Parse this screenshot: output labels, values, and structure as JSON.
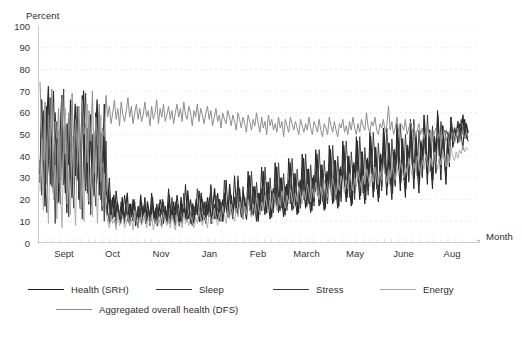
{
  "chart_data": {
    "type": "line",
    "title": "",
    "subtitle": "",
    "xlabel": "Month",
    "ylabel": "Percent",
    "ylim": [
      0,
      100
    ],
    "ytick_labels": [
      "100",
      "90",
      "80",
      "70",
      "60",
      "50",
      "40",
      "30",
      "20",
      "10",
      "0"
    ],
    "ytick_values": [
      100,
      90,
      80,
      70,
      60,
      50,
      40,
      30,
      20,
      10,
      0
    ],
    "xtick_labels": [
      "Sept",
      "Oct",
      "Nov",
      "Jan",
      "Feb",
      "March",
      "May",
      "June",
      "Aug"
    ],
    "grid": "horizontal-dashed-light",
    "legend_position": "below-plot-left",
    "axis_style": "arrow-ended-l-shape",
    "legend": [
      {
        "name": "Health (SRH)",
        "color": "#232323",
        "width": 1.0
      },
      {
        "name": "Sleep",
        "color": "#2b2b2b",
        "width": 1.3
      },
      {
        "name": "Stress",
        "color": "#3a3a3a",
        "width": 0.9
      },
      {
        "name": "Energy",
        "color": "#a8a8a8",
        "width": 0.9
      },
      {
        "name": "Aggregated overall health (DFS)",
        "color": "#8d8d8d",
        "width": 1.0
      }
    ],
    "series": [
      {
        "name": "Health (SRH)",
        "color": "#232323",
        "values": [
          32,
          58,
          44,
          21,
          63,
          38,
          27,
          52,
          70,
          34,
          18,
          47,
          29,
          61,
          40,
          23,
          55,
          36,
          66,
          26,
          49,
          31,
          57,
          20,
          43,
          68,
          35,
          24,
          53,
          39,
          17,
          46,
          28,
          60,
          33,
          22,
          51,
          37,
          64,
          25,
          19,
          30,
          14,
          21,
          12,
          24,
          16,
          11,
          19,
          13,
          22,
          15,
          10,
          18,
          12,
          20,
          14,
          9,
          17,
          11,
          19,
          13,
          21,
          10,
          16,
          12,
          23,
          14,
          11,
          18,
          13,
          20,
          15,
          9,
          17,
          12,
          25,
          14,
          11,
          19,
          13,
          22,
          16,
          10,
          18,
          12,
          27,
          15,
          11,
          20,
          14,
          9,
          17,
          13,
          24,
          16,
          10,
          19,
          12,
          21,
          15,
          26,
          13,
          18,
          11,
          23,
          16,
          10,
          20,
          14,
          29,
          17,
          12,
          22,
          15,
          31,
          18,
          13,
          25,
          16,
          11,
          21,
          14,
          33,
          19,
          12,
          26,
          17,
          10,
          23,
          15,
          35,
          20,
          13,
          28,
          18,
          11,
          24,
          16,
          37,
          22,
          14,
          30,
          19,
          12,
          26,
          17,
          39,
          23,
          15,
          32,
          20,
          13,
          28,
          18,
          41,
          24,
          16,
          34,
          21,
          14,
          30,
          19,
          43,
          26,
          17,
          36,
          22,
          15,
          32,
          20,
          45,
          27,
          18,
          38,
          24,
          16,
          34,
          21,
          47,
          29,
          19,
          40,
          25,
          17,
          36,
          23,
          49,
          31,
          20,
          42,
          27,
          18,
          38,
          24,
          51,
          33,
          21,
          44,
          28,
          19,
          40,
          26,
          53,
          35,
          22,
          46,
          30,
          20,
          42,
          27,
          55,
          37,
          24,
          48,
          32,
          21,
          44,
          29,
          57,
          39,
          25,
          50,
          34,
          23,
          46,
          31,
          59,
          41,
          27,
          52,
          36,
          25,
          48,
          33,
          61,
          43,
          29,
          54,
          38,
          27,
          50,
          35,
          58,
          44,
          48,
          52,
          46,
          55,
          50,
          43,
          57,
          51,
          47
        ]
      },
      {
        "name": "Sleep",
        "color": "#2b2b2b",
        "values": [
          28,
          66,
          39,
          17,
          55,
          72,
          31,
          44,
          23,
          60,
          35,
          19,
          50,
          68,
          27,
          41,
          14,
          57,
          33,
          21,
          46,
          64,
          29,
          37,
          16,
          53,
          70,
          25,
          43,
          18,
          59,
          31,
          22,
          48,
          66,
          27,
          39,
          15,
          54,
          20,
          13,
          24,
          10,
          17,
          22,
          12,
          19,
          14,
          9,
          21,
          11,
          16,
          23,
          10,
          18,
          13,
          20,
          8,
          15,
          11,
          22,
          12,
          17,
          9,
          19,
          14,
          10,
          21,
          12,
          16,
          8,
          18,
          13,
          20,
          11,
          15,
          9,
          22,
          12,
          17,
          10,
          19,
          14,
          8,
          21,
          13,
          16,
          11,
          24,
          15,
          9,
          18,
          12,
          20,
          14,
          10,
          23,
          16,
          11,
          19,
          13,
          21,
          9,
          17,
          25,
          14,
          11,
          20,
          15,
          10,
          23,
          16,
          12,
          27,
          18,
          13,
          21,
          15,
          29,
          19,
          12,
          24,
          17,
          11,
          22,
          31,
          16,
          13,
          26,
          18,
          10,
          23,
          15,
          33,
          20,
          14,
          28,
          17,
          12,
          25,
          19,
          35,
          22,
          15,
          30,
          18,
          13,
          27,
          20,
          37,
          24,
          16,
          32,
          19,
          14,
          29,
          22,
          39,
          26,
          17,
          34,
          21,
          15,
          31,
          24,
          41,
          28,
          18,
          36,
          23,
          16,
          33,
          26,
          43,
          30,
          19,
          38,
          25,
          17,
          35,
          28,
          45,
          32,
          21,
          40,
          27,
          18,
          37,
          30,
          47,
          34,
          22,
          42,
          29,
          20,
          39,
          32,
          49,
          36,
          24,
          44,
          31,
          21,
          41,
          34,
          51,
          38,
          26,
          46,
          33,
          23,
          43,
          36,
          53,
          40,
          28,
          48,
          35,
          25,
          45,
          38,
          55,
          42,
          30,
          50,
          37,
          27,
          47,
          40,
          57,
          44,
          32,
          52,
          39,
          29,
          49,
          42,
          59,
          46,
          35,
          54,
          41,
          31,
          51,
          45,
          57,
          48,
          53,
          50,
          56,
          47,
          52,
          59,
          49,
          55,
          51
        ]
      },
      {
        "name": "Stress",
        "color": "#3a3a3a",
        "values": [
          38,
          22,
          61,
          30,
          14,
          48,
          67,
          26,
          42,
          9,
          56,
          33,
          18,
          51,
          71,
          24,
          40,
          12,
          58,
          29,
          16,
          45,
          63,
          21,
          37,
          11,
          54,
          69,
          23,
          39,
          13,
          50,
          27,
          17,
          43,
          60,
          20,
          35,
          10,
          47,
          15,
          9,
          20,
          11,
          16,
          8,
          18,
          13,
          10,
          15,
          9,
          17,
          12,
          8,
          14,
          10,
          19,
          11,
          7,
          16,
          9,
          13,
          18,
          10,
          15,
          8,
          20,
          12,
          9,
          17,
          11,
          14,
          8,
          19,
          12,
          10,
          16,
          9,
          21,
          13,
          8,
          18,
          11,
          15,
          9,
          23,
          14,
          10,
          19,
          12,
          8,
          17,
          13,
          25,
          15,
          10,
          20,
          14,
          9,
          18,
          12,
          27,
          16,
          11,
          22,
          15,
          10,
          19,
          13,
          29,
          17,
          12,
          24,
          16,
          11,
          21,
          14,
          31,
          18,
          13,
          26,
          17,
          12,
          23,
          15,
          33,
          20,
          14,
          28,
          18,
          13,
          25,
          16,
          35,
          22,
          15,
          30,
          19,
          14,
          27,
          17,
          37,
          24,
          16,
          32,
          21,
          15,
          29,
          18,
          39,
          26,
          17,
          34,
          23,
          16,
          31,
          20,
          41,
          28,
          18,
          36,
          25,
          17,
          33,
          22,
          43,
          30,
          19,
          38,
          27,
          18,
          35,
          24,
          45,
          32,
          20,
          40,
          29,
          19,
          37,
          26,
          47,
          34,
          21,
          42,
          31,
          20,
          39,
          28,
          49,
          36,
          23,
          44,
          33,
          22,
          41,
          30,
          51,
          38,
          25,
          46,
          35,
          24,
          43,
          32,
          53,
          40,
          27,
          48,
          37,
          26,
          45,
          34,
          55,
          42,
          29,
          50,
          39,
          28,
          47,
          36,
          57,
          44,
          31,
          52,
          41,
          30,
          49,
          38,
          59,
          46,
          33,
          54,
          43,
          32,
          51,
          40,
          56,
          48,
          44,
          52,
          50,
          46,
          58,
          47,
          53,
          49,
          55,
          51,
          57,
          50,
          54,
          48,
          52
        ]
      },
      {
        "name": "Energy",
        "color": "#a8a8a8",
        "values": [
          24,
          48,
          15,
          58,
          31,
          9,
          42,
          66,
          20,
          36,
          11,
          52,
          27,
          7,
          45,
          62,
          18,
          33,
          13,
          49,
          25,
          8,
          40,
          57,
          16,
          30,
          10,
          46,
          64,
          19,
          35,
          12,
          51,
          28,
          9,
          43,
          59,
          17,
          32,
          14,
          10,
          7,
          13,
          9,
          11,
          6,
          14,
          8,
          10,
          12,
          7,
          9,
          13,
          8,
          11,
          6,
          15,
          9,
          7,
          12,
          8,
          10,
          14,
          7,
          11,
          9,
          13,
          6,
          10,
          8,
          12,
          9,
          7,
          14,
          10,
          8,
          11,
          7,
          13,
          9,
          6,
          12,
          8,
          10,
          7,
          14,
          9,
          11,
          8,
          13,
          10,
          7,
          12,
          9,
          15,
          11,
          8,
          13,
          10,
          7,
          14,
          11,
          9,
          16,
          12,
          8,
          14,
          10,
          17,
          13,
          9,
          15,
          11,
          18,
          14,
          10,
          16,
          12,
          19,
          15,
          11,
          17,
          13,
          20,
          16,
          12,
          18,
          14,
          21,
          17,
          13,
          19,
          15,
          22,
          18,
          14,
          20,
          16,
          23,
          19,
          15,
          21,
          17,
          24,
          20,
          16,
          22,
          18,
          25,
          21,
          17,
          23,
          19,
          26,
          22,
          18,
          24,
          20,
          27,
          23,
          19,
          25,
          21,
          28,
          24,
          20,
          26,
          22,
          29,
          25,
          21,
          27,
          23,
          30,
          26,
          22,
          28,
          24,
          31,
          27,
          23,
          29,
          25,
          32,
          28,
          24,
          30,
          26,
          33,
          29,
          25,
          31,
          27,
          34,
          30,
          26,
          32,
          28,
          35,
          31,
          27,
          33,
          29,
          36,
          32,
          28,
          34,
          30,
          37,
          33,
          29,
          35,
          31,
          38,
          34,
          30,
          36,
          32,
          39,
          35,
          31,
          37,
          33,
          40,
          36,
          32,
          38,
          34,
          41,
          37,
          33,
          39,
          35,
          42,
          38,
          34,
          40,
          36,
          43,
          39,
          35,
          41,
          37,
          44,
          40,
          38,
          42,
          39,
          43,
          41,
          45,
          42,
          44,
          43
        ]
      },
      {
        "name": "Aggregated overall health (DFS)",
        "color": "#8d8d8d",
        "values": [
          74,
          52,
          38,
          65,
          27,
          59,
          44,
          71,
          33,
          56,
          48,
          62,
          30,
          67,
          41,
          54,
          25,
          60,
          46,
          69,
          35,
          57,
          43,
          63,
          29,
          66,
          50,
          55,
          37,
          61,
          47,
          70,
          32,
          58,
          45,
          64,
          28,
          53,
          49,
          68,
          58,
          63,
          55,
          60,
          66,
          57,
          62,
          54,
          65,
          59,
          56,
          61,
          67,
          58,
          63,
          55,
          60,
          64,
          57,
          62,
          56,
          59,
          65,
          58,
          61,
          54,
          63,
          57,
          60,
          66,
          55,
          62,
          58,
          64,
          56,
          59,
          63,
          57,
          61,
          55,
          60,
          64,
          58,
          62,
          56,
          65,
          59,
          57,
          63,
          60,
          54,
          61,
          58,
          64,
          56,
          62,
          59,
          55,
          60,
          63,
          57,
          61,
          54,
          58,
          62,
          56,
          59,
          53,
          60,
          57,
          55,
          61,
          58,
          54,
          59,
          56,
          52,
          60,
          57,
          53,
          58,
          55,
          51,
          59,
          56,
          52,
          57,
          54,
          60,
          55,
          51,
          58,
          53,
          56,
          50,
          59,
          54,
          57,
          52,
          55,
          51,
          58,
          53,
          56,
          49,
          57,
          54,
          51,
          58,
          55,
          52,
          56,
          53,
          50,
          57,
          54,
          51,
          55,
          52,
          58,
          53,
          50,
          56,
          54,
          51,
          57,
          52,
          49,
          55,
          53,
          50,
          58,
          54,
          51,
          56,
          52,
          49,
          55,
          53,
          57,
          51,
          54,
          50,
          56,
          52,
          58,
          53,
          50,
          55,
          51,
          57,
          54,
          52,
          60,
          53,
          51,
          56,
          54,
          58,
          52,
          50,
          55,
          53,
          57,
          51,
          54,
          63,
          52,
          56,
          50,
          53,
          58,
          51,
          55,
          54,
          52,
          57,
          50,
          53,
          56,
          51,
          54,
          49,
          52,
          55,
          50,
          53,
          48,
          51,
          54,
          49,
          52,
          47,
          50,
          53,
          48,
          51,
          46,
          49,
          52,
          47,
          50,
          45,
          48,
          51,
          46,
          49,
          53,
          47,
          50,
          52,
          48,
          51,
          49
        ]
      }
    ]
  }
}
